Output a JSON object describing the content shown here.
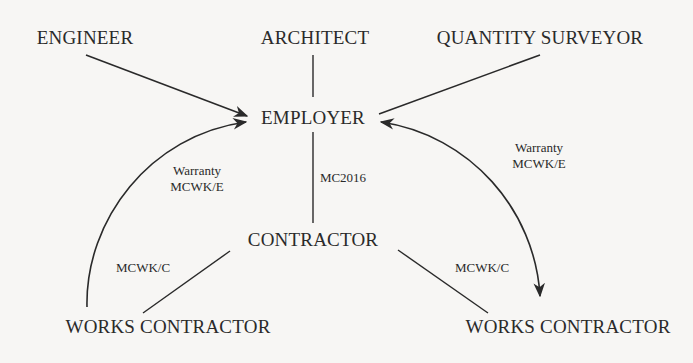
{
  "diagram": {
    "nodes": {
      "engineer": "ENGINEER",
      "architect": "ARCHITECT",
      "quantity_surveyor": "QUANTITY SURVEYOR",
      "employer": "EMPLOYER",
      "contractor": "CONTRACTOR",
      "works_contractor_left": "WORKS CONTRACTOR",
      "works_contractor_right": "WORKS CONTRACTOR"
    },
    "edge_labels": {
      "employer_contractor": "MC2016",
      "warranty_left_line1": "Warranty",
      "warranty_left_line2": "MCWK/E",
      "warranty_right_line1": "Warranty",
      "warranty_right_line2": "MCWK/E",
      "contractor_works_left": "MCWK/C",
      "contractor_works_right": "MCWK/C"
    },
    "colors": {
      "line": "#2a2a2a",
      "background": "#f7f6f4"
    }
  }
}
